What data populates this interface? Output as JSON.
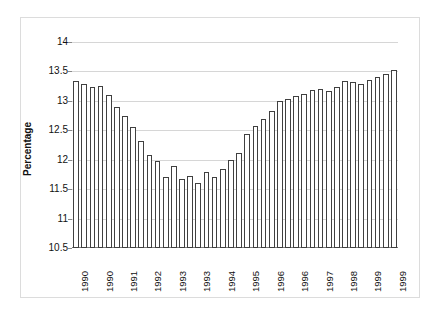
{
  "chart_data": {
    "type": "bar",
    "title": "",
    "subtitle": "",
    "xlabel": "",
    "ylabel": "Percentage",
    "ylim": [
      10.5,
      14
    ],
    "yticks": [
      10.5,
      11,
      11.5,
      12,
      12.5,
      13,
      13.5,
      14
    ],
    "ytick_labels": [
      "10.5",
      "11",
      "11.5",
      "12",
      "12.5",
      "13",
      "13.5",
      "14"
    ],
    "grid": true,
    "legend": null,
    "bar_fill_color": "#ffffff",
    "bar_edge_color": "#404040",
    "gridline_color": "#d6d6d6",
    "frame_color": "#dcdcdc",
    "categories": [
      "1990",
      "1990",
      "1990",
      "1990",
      "1991",
      "1991",
      "1991",
      "1991",
      "1992",
      "1992",
      "1992",
      "1992",
      "1993",
      "1993",
      "1993",
      "1993",
      "1994",
      "1994",
      "1994",
      "1994",
      "1995",
      "1995",
      "1995",
      "1995",
      "1996",
      "1996",
      "1996",
      "1996",
      "1997",
      "1997",
      "1997",
      "1997",
      "1998",
      "1998",
      "1998",
      "1998",
      "1999",
      "1999",
      "1999",
      "1999"
    ],
    "values": [
      13.33,
      13.28,
      13.24,
      13.26,
      13.1,
      12.89,
      12.74,
      12.56,
      12.31,
      12.08,
      11.98,
      11.7,
      11.89,
      11.68,
      11.72,
      11.6,
      11.79,
      11.71,
      11.84,
      12.0,
      12.11,
      12.44,
      12.58,
      12.69,
      12.82,
      12.99,
      13.03,
      13.09,
      13.11,
      13.19,
      13.2,
      13.16,
      13.24,
      13.33,
      13.32,
      13.29,
      13.35,
      13.4,
      13.46,
      13.52
    ],
    "xtick_labels": [
      "1990",
      "1990",
      "1991",
      "1992",
      "1993",
      "1993",
      "1994",
      "1995",
      "1996",
      "1996",
      "1997",
      "1998",
      "1999",
      "1999"
    ],
    "xtick_indices": [
      0,
      3,
      6,
      9,
      12,
      15,
      18,
      21,
      24,
      27,
      30,
      33,
      36,
      39
    ]
  }
}
